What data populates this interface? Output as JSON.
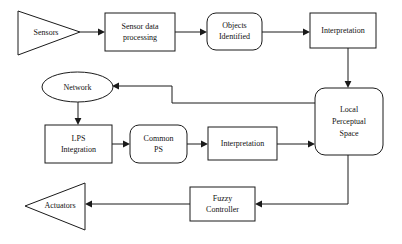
{
  "diagram": {
    "colors": {
      "stroke": "#1a1a1a",
      "fill": "#ffffff",
      "text": "#111111",
      "background": "#ffffff"
    },
    "nodes": [
      {
        "id": "sensors",
        "shape": "triangle-right",
        "label": "Sensors",
        "lines": [
          "Sensors"
        ]
      },
      {
        "id": "sensor-data-processing",
        "shape": "rectangle",
        "label": "Sensor data processing",
        "lines": [
          "Sensor data",
          "processing"
        ]
      },
      {
        "id": "objects-identified",
        "shape": "rounded-rectangle",
        "label": "Objects Identified",
        "lines": [
          "Objects",
          "Identified"
        ]
      },
      {
        "id": "interpretation-top",
        "shape": "rectangle",
        "label": "Interpretation",
        "lines": [
          "Interpretation"
        ]
      },
      {
        "id": "local-perceptual-space",
        "shape": "rounded-rectangle",
        "label": "Local Perceptual Space",
        "lines": [
          "Local",
          "Perceptual",
          "Space"
        ]
      },
      {
        "id": "network",
        "shape": "ellipse",
        "label": "Network",
        "lines": [
          "Network"
        ]
      },
      {
        "id": "lps-integration",
        "shape": "rectangle",
        "label": "LPS Integration",
        "lines": [
          "LPS",
          "Integration"
        ]
      },
      {
        "id": "common-ps",
        "shape": "rounded-rectangle",
        "label": "Common PS",
        "lines": [
          "Common",
          "PS"
        ]
      },
      {
        "id": "interpretation-bottom",
        "shape": "rectangle",
        "label": "Interpretation",
        "lines": [
          "Interpretation"
        ]
      },
      {
        "id": "fuzzy-controller",
        "shape": "rectangle",
        "label": "Fuzzy Controller",
        "lines": [
          "Fuzzy",
          "Controller"
        ]
      },
      {
        "id": "actuators",
        "shape": "triangle-left",
        "label": "Actuators",
        "lines": [
          "Actuators"
        ]
      }
    ],
    "edges": [
      {
        "id": "sensors-to-sensor-data-processing",
        "from": "sensors",
        "to": "sensor-data-processing"
      },
      {
        "id": "sensor-data-processing-to-objects-identified",
        "from": "sensor-data-processing",
        "to": "objects-identified"
      },
      {
        "id": "objects-identified-to-interpretation-top",
        "from": "objects-identified",
        "to": "interpretation-top"
      },
      {
        "id": "interpretation-top-to-local-perceptual-space",
        "from": "interpretation-top",
        "to": "local-perceptual-space"
      },
      {
        "id": "local-perceptual-space-to-network",
        "from": "local-perceptual-space",
        "to": "network"
      },
      {
        "id": "network-to-lps-integration",
        "from": "network",
        "to": "lps-integration"
      },
      {
        "id": "lps-integration-to-common-ps",
        "from": "lps-integration",
        "to": "common-ps"
      },
      {
        "id": "common-ps-to-interpretation-bottom",
        "from": "common-ps",
        "to": "interpretation-bottom"
      },
      {
        "id": "interpretation-bottom-to-local-perceptual-space",
        "from": "interpretation-bottom",
        "to": "local-perceptual-space"
      },
      {
        "id": "local-perceptual-space-to-fuzzy-controller",
        "from": "local-perceptual-space",
        "to": "fuzzy-controller"
      },
      {
        "id": "fuzzy-controller-to-actuators",
        "from": "fuzzy-controller",
        "to": "actuators"
      }
    ]
  }
}
